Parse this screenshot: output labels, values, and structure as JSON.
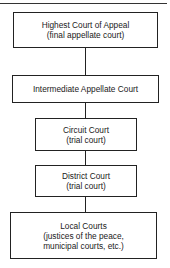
{
  "diagram": {
    "type": "hierarchy-flowchart",
    "nodes": [
      {
        "id": "highest",
        "lines": [
          "Highest Court of Appeal",
          "(final appellate court)"
        ]
      },
      {
        "id": "intermediate",
        "lines": [
          "Intermediate Appellate Court"
        ]
      },
      {
        "id": "circuit",
        "lines": [
          "Circuit Court",
          "(trial court)"
        ]
      },
      {
        "id": "district",
        "lines": [
          "District Court",
          "(trial court)"
        ]
      },
      {
        "id": "local",
        "lines": [
          "Local Courts",
          "(justices of the peace,",
          "municipal courts, etc.)"
        ]
      }
    ],
    "edges": [
      [
        "highest",
        "intermediate"
      ],
      [
        "intermediate",
        "circuit"
      ],
      [
        "circuit",
        "district"
      ],
      [
        "district",
        "local"
      ]
    ]
  }
}
